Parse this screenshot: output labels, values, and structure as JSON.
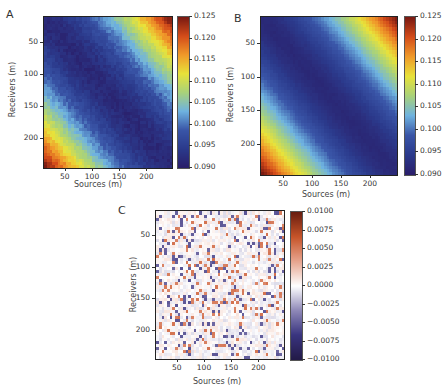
{
  "chart_data": [
    {
      "panel": "A",
      "type": "heatmap",
      "title": "",
      "xlabel": "Sources (m)",
      "ylabel": "Receivers (m)",
      "xlim": [
        10,
        245
      ],
      "ylim": [
        245,
        10
      ],
      "xticks": [
        50,
        100,
        150,
        200
      ],
      "yticks": [
        50,
        100,
        150,
        200
      ],
      "colormap": "jet-like (dark blue → light blue → yellow → orange → dark red)",
      "colorbar": {
        "min": 0.09,
        "max": 0.125,
        "ticks": [
          "0.125",
          "0.120",
          "0.115",
          "0.110",
          "0.105",
          "0.100",
          "0.095",
          "0.090"
        ]
      },
      "pattern": "minimum (~0.092) along main diagonal (receiver ≈ source), increasing toward top-right and bottom-left corners (~0.125)",
      "noise": "slight pixel noise"
    },
    {
      "panel": "B",
      "type": "heatmap",
      "title": "",
      "xlabel": "Sources (m)",
      "ylabel": "Receivers (m)",
      "xlim": [
        10,
        245
      ],
      "ylim": [
        245,
        10
      ],
      "xticks": [
        50,
        100,
        150,
        200
      ],
      "yticks": [
        50,
        100,
        150,
        200
      ],
      "colormap": "jet-like (dark blue → light blue → yellow → orange → dark red)",
      "colorbar": {
        "min": 0.09,
        "max": 0.125,
        "ticks": [
          "0.125",
          "0.120",
          "0.115",
          "0.110",
          "0.105",
          "0.100",
          "0.095",
          "0.090"
        ]
      },
      "pattern": "smooth version of A: minimum along main diagonal, increasing toward top-right and bottom-left corners",
      "noise": "very little"
    },
    {
      "panel": "C",
      "type": "heatmap",
      "title": "",
      "xlabel": "Sources (m)",
      "ylabel": "Receivers (m)",
      "xlim": [
        10,
        245
      ],
      "ylim": [
        245,
        10
      ],
      "xticks": [
        50,
        100,
        150,
        200
      ],
      "yticks": [
        50,
        100,
        150,
        200
      ],
      "colormap": "diverging (dark navy → white → dark red)",
      "colorbar": {
        "min": -0.01,
        "max": 0.01,
        "ticks": [
          "0.0100",
          "0.0075",
          "0.0050",
          "0.0025",
          "0.0000",
          "−0.0025",
          "−0.0050",
          "−0.0075",
          "−0.0100"
        ]
      },
      "pattern": "difference A − B: near-zero random noise (mostly white with faint red/blue speckles)"
    }
  ],
  "labels": {
    "panel_a": "A",
    "panel_b": "B",
    "panel_c": "C",
    "xlabel": "Sources (m)",
    "ylabel": "Receivers (m)",
    "axis_ticks": [
      "50",
      "100",
      "150",
      "200"
    ]
  },
  "colors": {
    "jet": [
      "#2a1f6b",
      "#2b3a8c",
      "#3a56a8",
      "#6fb3e0",
      "#a9d27a",
      "#e8e23a",
      "#f09a2a",
      "#d44c1a",
      "#7a1a12"
    ],
    "diverging": [
      "#231a48",
      "#3a3580",
      "#8f89b8",
      "#ffffff",
      "#e8a58f",
      "#c7552a",
      "#6a1e10"
    ]
  }
}
